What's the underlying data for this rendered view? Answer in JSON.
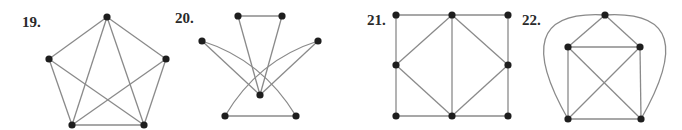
{
  "figures": [
    {
      "label": "19.",
      "vertices": {
        "a": [
          107,
          17
        ],
        "b": [
          49,
          59
        ],
        "c": [
          166,
          59
        ],
        "d": [
          72,
          125
        ],
        "e": [
          144,
          125
        ]
      },
      "edges": [
        [
          "a",
          "b"
        ],
        [
          "a",
          "c"
        ],
        [
          "b",
          "d"
        ],
        [
          "c",
          "e"
        ],
        [
          "d",
          "e"
        ],
        [
          "a",
          "d"
        ],
        [
          "a",
          "e"
        ],
        [
          "b",
          "e"
        ],
        [
          "c",
          "d"
        ]
      ],
      "curves": []
    },
    {
      "label": "20.",
      "vertices": {
        "a": [
          238,
          16
        ],
        "b": [
          282,
          16
        ],
        "c": [
          202,
          41
        ],
        "d": [
          318,
          41
        ],
        "m": [
          260,
          95
        ],
        "f": [
          225,
          116
        ],
        "g": [
          296,
          116
        ]
      },
      "edges": [
        [
          "a",
          "b"
        ],
        [
          "a",
          "m"
        ],
        [
          "b",
          "m"
        ],
        [
          "c",
          "m"
        ],
        [
          "d",
          "m"
        ],
        [
          "f",
          "g"
        ]
      ],
      "curves": [
        [
          "c",
          "g",
          [
            262,
            60
          ]
        ],
        [
          "d",
          "f",
          [
            258,
            60
          ]
        ]
      ]
    },
    {
      "label": "21.",
      "vertices": {
        "a": [
          396,
          15
        ],
        "b": [
          452,
          15
        ],
        "c": [
          508,
          15
        ],
        "d": [
          396,
          65
        ],
        "e": [
          508,
          65
        ],
        "f": [
          396,
          116
        ],
        "g": [
          452,
          116
        ],
        "h": [
          508,
          116
        ]
      },
      "edges": [
        [
          "a",
          "b"
        ],
        [
          "b",
          "c"
        ],
        [
          "f",
          "g"
        ],
        [
          "g",
          "h"
        ],
        [
          "a",
          "d"
        ],
        [
          "d",
          "f"
        ],
        [
          "c",
          "e"
        ],
        [
          "e",
          "h"
        ],
        [
          "b",
          "g"
        ],
        [
          "b",
          "d"
        ],
        [
          "d",
          "g"
        ],
        [
          "b",
          "e"
        ],
        [
          "e",
          "g"
        ]
      ],
      "curves": []
    },
    {
      "label": "22.",
      "vertices": {
        "t": [
          605,
          15
        ],
        "p": [
          568,
          47
        ],
        "q": [
          640,
          47
        ],
        "r": [
          568,
          119
        ],
        "s": [
          641,
          119
        ]
      },
      "edges": [
        [
          "t",
          "p"
        ],
        [
          "t",
          "q"
        ],
        [
          "p",
          "q"
        ],
        [
          "p",
          "r"
        ],
        [
          "q",
          "s"
        ],
        [
          "r",
          "s"
        ],
        [
          "p",
          "s"
        ],
        [
          "q",
          "r"
        ]
      ],
      "curves": [
        [
          "t",
          "r",
          "left"
        ],
        [
          "t",
          "s",
          "right"
        ]
      ]
    }
  ]
}
